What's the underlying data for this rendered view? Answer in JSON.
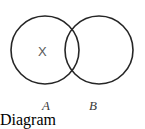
{
  "figure": {
    "kind": "venn-diagram",
    "background_color": "#ffffff",
    "stroke_color": "#262626",
    "stroke_width": 1.6,
    "width": 145,
    "height": 111
  },
  "sets": [
    {
      "id": "A",
      "label": "A",
      "label_style": "italic",
      "center_x": 45,
      "center_y": 50,
      "radius": 34
    },
    {
      "id": "B",
      "label": "B",
      "label_style": "italic",
      "center_x": 99,
      "center_y": 50,
      "radius": 34
    }
  ],
  "markers": [
    {
      "id": "x-marker",
      "text": "X",
      "region": "A-only",
      "x": 43,
      "y": 52,
      "color": "#5a5a5a"
    }
  ],
  "intersection_points": [
    {
      "x": 72,
      "y": 20
    },
    {
      "x": 72,
      "y": 81
    }
  ]
}
